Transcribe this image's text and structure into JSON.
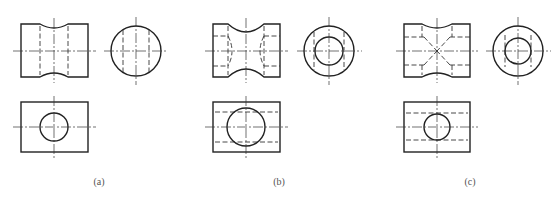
{
  "figure": {
    "panels": [
      {
        "id": "a",
        "label": "(a)",
        "label_x": 99,
        "description": "Cylinder with concave waist; through hole straight (hidden lines vertical)"
      },
      {
        "id": "b",
        "label": "(b)",
        "label_x": 279,
        "description": "Cylinder with concave waist; stepped hole with curved transitions"
      },
      {
        "id": "c",
        "label": "(c)",
        "label_x": 470,
        "description": "Cylinder with concave waist; hole with conical transitions"
      }
    ],
    "colors": {
      "line": "#222222",
      "background": "#ffffff",
      "label": "#555555"
    }
  }
}
